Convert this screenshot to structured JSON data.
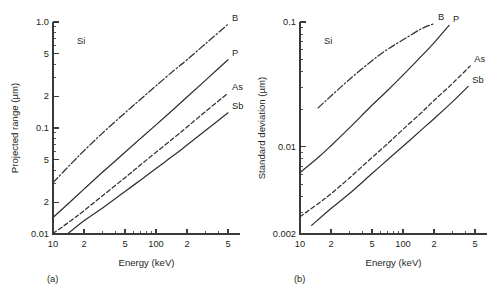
{
  "figure": {
    "background": "#ffffff",
    "ink_color": "#333033",
    "panels": [
      "a",
      "b"
    ]
  },
  "chart_data": [
    {
      "id": "panel-a",
      "type": "line",
      "title": "",
      "caption": "(a)",
      "annotation": "Si",
      "xlabel": "Energy (keV)",
      "ylabel": "Projected range (µm)",
      "xscale": "log",
      "yscale": "log",
      "xlim": [
        10,
        500
      ],
      "ylim": [
        0.01,
        1.0
      ],
      "grid": false,
      "legend_position": "curve-end-labels",
      "xticks": [
        10,
        20,
        50,
        100,
        200,
        500
      ],
      "xtick_labels": [
        "10",
        "2",
        "5",
        "100",
        "2",
        "5"
      ],
      "xminor": [
        30,
        40,
        60,
        70,
        80,
        90,
        300,
        400
      ],
      "yticks": [
        0.01,
        0.02,
        0.05,
        0.1,
        0.2,
        0.5,
        1.0
      ],
      "ytick_labels": [
        "0.01",
        "2",
        "5",
        "0.1",
        "2",
        "5",
        "1.0"
      ],
      "yminor": [
        0.03,
        0.04,
        0.06,
        0.07,
        0.08,
        0.09,
        0.3,
        0.4,
        0.6,
        0.7,
        0.8,
        0.9
      ],
      "series": [
        {
          "name": "B",
          "label": "B",
          "style": "dashdot",
          "x": [
            10,
            15,
            20,
            30,
            50,
            70,
            100,
            150,
            200,
            300,
            500
          ],
          "y": [
            0.0305,
            0.046,
            0.061,
            0.089,
            0.139,
            0.185,
            0.25,
            0.35,
            0.44,
            0.62,
            0.95
          ]
        },
        {
          "name": "P",
          "label": "P",
          "style": "solid",
          "x": [
            10,
            15,
            20,
            30,
            50,
            70,
            100,
            150,
            200,
            300,
            500
          ],
          "y": [
            0.0143,
            0.0205,
            0.0265,
            0.038,
            0.059,
            0.079,
            0.107,
            0.152,
            0.196,
            0.28,
            0.44
          ]
        },
        {
          "name": "As",
          "label": "As",
          "style": "dashed",
          "x": [
            10,
            15,
            20,
            30,
            50,
            70,
            100,
            150,
            200,
            300,
            500
          ],
          "y": [
            0.0101,
            0.0134,
            0.0166,
            0.0228,
            0.034,
            0.0445,
            0.059,
            0.081,
            0.102,
            0.142,
            0.213
          ]
        },
        {
          "name": "Sb",
          "label": "Sb",
          "style": "solid",
          "x": [
            14,
            20,
            30,
            50,
            70,
            100,
            150,
            200,
            300,
            500
          ],
          "y": [
            0.0101,
            0.0133,
            0.0175,
            0.0252,
            0.032,
            0.0415,
            0.0555,
            0.069,
            0.094,
            0.139
          ]
        }
      ]
    },
    {
      "id": "panel-b",
      "type": "line",
      "title": "",
      "caption": "(b)",
      "annotation": "Si",
      "xlabel": "Energy (keV)",
      "ylabel": "Standard deviation (µm)",
      "xscale": "log",
      "yscale": "log",
      "xlim": [
        10,
        500
      ],
      "ylim": [
        0.002,
        0.1
      ],
      "grid": false,
      "legend_position": "curve-end-labels",
      "xticks": [
        10,
        20,
        50,
        100,
        200,
        500
      ],
      "xtick_labels": [
        "10",
        "2",
        "5",
        "100",
        "2",
        "5"
      ],
      "xminor": [
        30,
        40,
        60,
        70,
        80,
        90,
        300,
        400
      ],
      "yticks": [
        0.002,
        0.01,
        0.1
      ],
      "ytick_labels": [
        "0.002",
        "0.01",
        "0.1"
      ],
      "yminor": [
        0.003,
        0.004,
        0.005,
        0.006,
        0.007,
        0.008,
        0.009,
        0.02,
        0.03,
        0.04,
        0.05,
        0.06,
        0.07,
        0.08,
        0.09
      ],
      "series": [
        {
          "name": "B",
          "label": "B",
          "style": "dashdot",
          "x": [
            15,
            20,
            30,
            50,
            70,
            100,
            150,
            200
          ],
          "y": [
            0.0205,
            0.0255,
            0.0345,
            0.049,
            0.06,
            0.072,
            0.088,
            0.097
          ]
        },
        {
          "name": "P",
          "label": "P",
          "style": "solid",
          "x": [
            10,
            15,
            20,
            30,
            50,
            70,
            100,
            150,
            200,
            280
          ],
          "y": [
            0.0062,
            0.0082,
            0.0102,
            0.0141,
            0.0215,
            0.028,
            0.0375,
            0.053,
            0.068,
            0.094
          ]
        },
        {
          "name": "As",
          "label": "As",
          "style": "dashed",
          "x": [
            10,
            15,
            20,
            30,
            50,
            70,
            100,
            150,
            200,
            300,
            450
          ],
          "y": [
            0.00275,
            0.0035,
            0.0042,
            0.0056,
            0.0082,
            0.0105,
            0.0138,
            0.0187,
            0.0235,
            0.032,
            0.0445
          ]
        },
        {
          "name": "Sb",
          "label": "Sb",
          "style": "solid",
          "x": [
            13,
            20,
            30,
            50,
            70,
            100,
            150,
            200,
            300,
            430
          ],
          "y": [
            0.00235,
            0.0032,
            0.0042,
            0.0061,
            0.0078,
            0.0101,
            0.0136,
            0.0168,
            0.0228,
            0.0305
          ]
        }
      ]
    }
  ]
}
